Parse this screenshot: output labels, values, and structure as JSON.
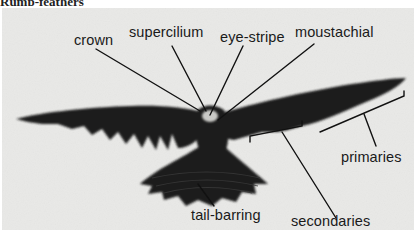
{
  "figure": {
    "top_cut_text": "Rump-feathers",
    "labels": {
      "crown": "crown",
      "supercilium": "supercilium",
      "eye_stripe": "eye-stripe",
      "moustachial": "moustachial",
      "primaries": "primaries",
      "secondaries": "secondaries",
      "tail_barring": "tail-barring"
    },
    "colors": {
      "background": "#e9e9e7",
      "bird": "#1c1c1c",
      "lines": "#111111"
    }
  }
}
